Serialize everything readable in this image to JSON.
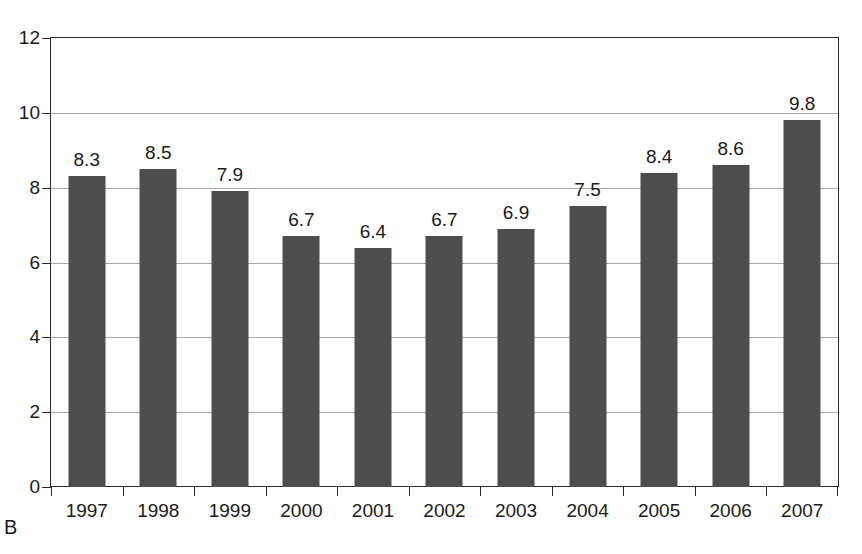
{
  "figure": {
    "panel_label": "B",
    "caption_remnant": ""
  },
  "chart_data": {
    "type": "bar",
    "title": "",
    "subtitle": "",
    "xlabel": "",
    "ylabel": "",
    "categories": [
      "1997",
      "1998",
      "1999",
      "2000",
      "2001",
      "2002",
      "2003",
      "2004",
      "2005",
      "2006",
      "2007"
    ],
    "values": [
      8.3,
      8.5,
      7.9,
      6.7,
      6.4,
      6.7,
      6.9,
      7.5,
      8.4,
      8.6,
      9.8
    ],
    "value_labels": [
      "8.3",
      "8.5",
      "7.9",
      "6.7",
      "6.4",
      "6.7",
      "6.9",
      "7.5",
      "8.4",
      "8.6",
      "9.8"
    ],
    "ylim": [
      0,
      12
    ],
    "yticks": [
      0,
      2,
      4,
      6,
      8,
      10,
      12
    ],
    "ytick_labels": [
      "0",
      "2",
      "4",
      "6",
      "8",
      "10",
      "12"
    ],
    "grid": true,
    "grid_axis": "y",
    "legend": false,
    "legend_position": "none",
    "bar_color": "#4d4d4d",
    "grid_color": "#a8a8a8",
    "axis_color": "#2b2b2b",
    "background_color": "#ffffff",
    "show_value_labels": true
  }
}
